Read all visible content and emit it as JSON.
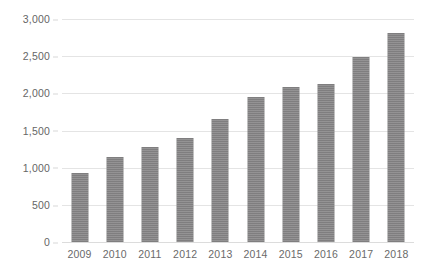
{
  "chart_data": {
    "type": "bar",
    "title": "",
    "subtitle": "",
    "xlabel": "",
    "ylabel": "",
    "categories": [
      "2009",
      "2010",
      "2011",
      "2012",
      "2013",
      "2014",
      "2015",
      "2016",
      "2017",
      "2018"
    ],
    "values": [
      930,
      1150,
      1280,
      1400,
      1660,
      1950,
      2090,
      2130,
      2490,
      2810
    ],
    "series": [
      {
        "name": "",
        "values": [
          930,
          1150,
          1280,
          1400,
          1660,
          1950,
          2090,
          2130,
          2490,
          2810
        ],
        "color": "#7f7e7f"
      }
    ],
    "ylim": [
      0,
      3000
    ],
    "y_ticks": [
      0,
      500,
      1000,
      1500,
      2000,
      2500,
      3000
    ],
    "y_tick_labels": [
      "0",
      "500",
      "1,000",
      "1,500",
      "2,000",
      "2,500",
      "3,000"
    ],
    "grid": true,
    "grid_color": "#e4e4e4",
    "legend": false,
    "legend_position": "none",
    "background_color": "#ffffff",
    "bar_color": "#7f7e7f",
    "tick_label_color": "#666666",
    "annotations": []
  }
}
